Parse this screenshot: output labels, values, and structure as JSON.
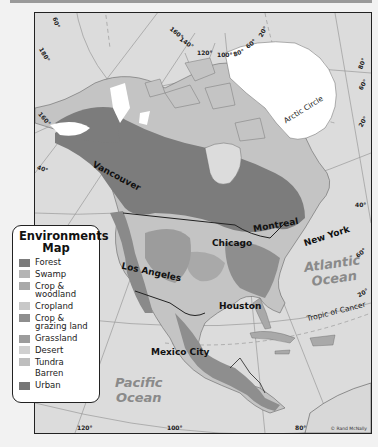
{
  "map": {
    "title_line1": "Environments",
    "title_line2": "Map",
    "cities": [
      {
        "name": "Vancouver"
      },
      {
        "name": "Montreal"
      },
      {
        "name": "Chicago"
      },
      {
        "name": "New York"
      },
      {
        "name": "Los Angeles"
      },
      {
        "name": "Houston"
      },
      {
        "name": "Mexico City"
      }
    ],
    "oceans": {
      "atlantic_line1": "Atlantic",
      "atlantic_line2": "Ocean",
      "pacific_line1": "Pacific",
      "pacific_line2": "Ocean"
    },
    "lines": {
      "arctic_circle": "Arctic Circle",
      "tropic_of_cancer": "Tropic of Cancer"
    },
    "longitude_labels": [
      "180°",
      "160°",
      "140°",
      "120°",
      "100°",
      "80°",
      "60°",
      "40°",
      "20°",
      "120°",
      "100°",
      "80°"
    ],
    "latitude_labels": [
      "60°",
      "40°",
      "20°",
      "80°",
      "60°",
      "40°",
      "60°",
      "40°",
      "20°"
    ],
    "credit": "© Rand McNally"
  },
  "legend": {
    "items": [
      {
        "label": "Forest",
        "color": "#7c7c7c"
      },
      {
        "label": "Swamp",
        "color": "#b4b4b4"
      },
      {
        "label": "Crop & woodland",
        "color": "#a9a9a9"
      },
      {
        "label": "Cropland",
        "color": "#c8c8c8"
      },
      {
        "label": "Crop & grazing land",
        "color": "#8e8e8e"
      },
      {
        "label": "Grassland",
        "color": "#9c9c9c"
      },
      {
        "label": "Desert",
        "color": "#d0d0d0"
      },
      {
        "label": "Tundra",
        "color": "#bebebe"
      },
      {
        "label": "Barren",
        "color": "#ffffff"
      },
      {
        "label": "Urban",
        "color": "#767676"
      }
    ]
  },
  "colors": {
    "water": "#dcdcdc",
    "land_light": "#c4c4c4",
    "forest": "#7c7c7c",
    "ice": "#ffffff",
    "border": "#222222"
  }
}
